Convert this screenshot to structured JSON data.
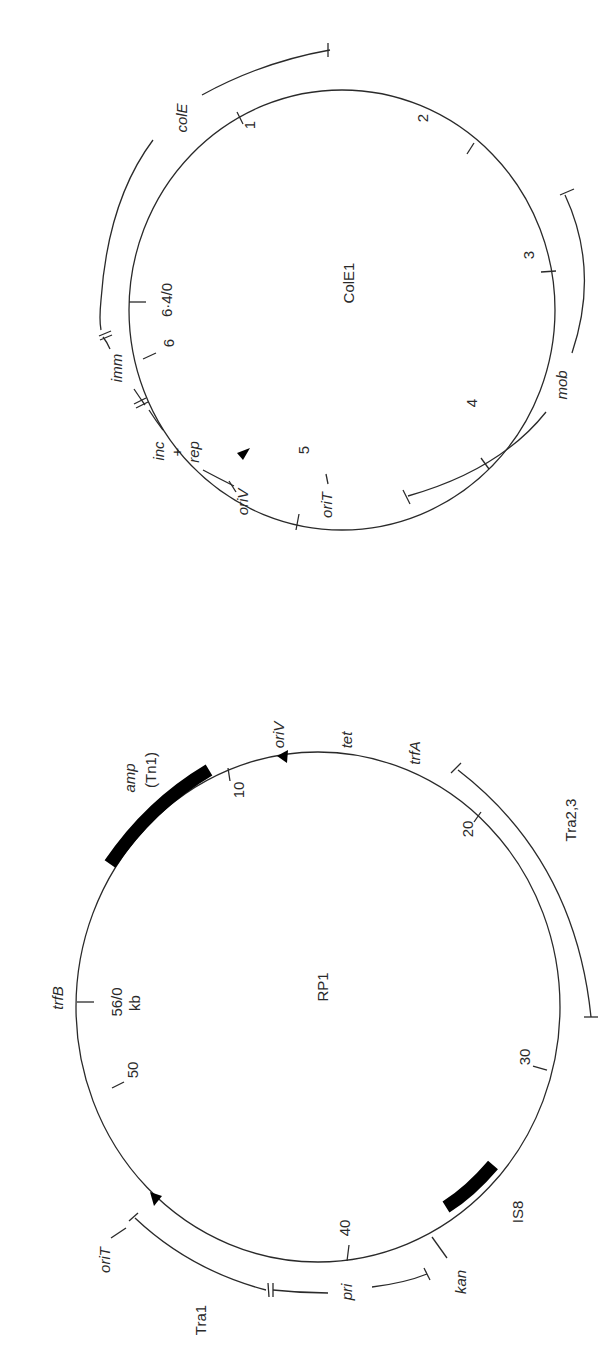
{
  "figure": {
    "orientation": "rotated 90 degrees counter-clockwise",
    "maps": [
      {
        "id": "cole1",
        "name": "ColE1",
        "size_kb": 6.4,
        "origin_label": "6·4/0",
        "ticks": [
          {
            "kb": 1,
            "label": "1"
          },
          {
            "kb": 2,
            "label": "2"
          },
          {
            "kb": 3,
            "label": "3"
          },
          {
            "kb": 4,
            "label": "4"
          },
          {
            "kb": 5,
            "label": "5"
          },
          {
            "kb": 6,
            "label": "6"
          }
        ],
        "regions": [
          {
            "name": "colE",
            "italic": true
          },
          {
            "name": "mob",
            "italic": true
          },
          {
            "name": "imm",
            "italic": true
          },
          {
            "name": "inc + rep",
            "italic": true
          }
        ],
        "sites": [
          {
            "name": "oriV",
            "italic": true,
            "marker": "arrow"
          },
          {
            "name": "oriT",
            "italic": true
          }
        ]
      },
      {
        "id": "rp1",
        "name": "RP1",
        "size_kb": 56,
        "origin_label": "56/0",
        "unit_label": "kb",
        "ticks": [
          {
            "kb": 10,
            "label": "10"
          },
          {
            "kb": 20,
            "label": "20"
          },
          {
            "kb": 30,
            "label": "30"
          },
          {
            "kb": 40,
            "label": "40"
          },
          {
            "kb": 50,
            "label": "50"
          }
        ],
        "regions": [
          {
            "name": "Tra2,3",
            "italic": false
          },
          {
            "name": "Tra1",
            "italic": false
          },
          {
            "name": "pri",
            "italic": true
          }
        ],
        "elements": [
          {
            "name": "amp",
            "sub": "(Tn1)",
            "type": "transposon-block"
          },
          {
            "name": "IS8",
            "type": "insertion-sequence-block"
          }
        ],
        "genes": [
          {
            "name": "tet",
            "italic": true
          },
          {
            "name": "trfA",
            "italic": true
          },
          {
            "name": "trfB",
            "italic": true
          },
          {
            "name": "kan",
            "italic": true
          }
        ],
        "sites": [
          {
            "name": "oriV",
            "italic": true,
            "marker": "arrow"
          },
          {
            "name": "oriT",
            "italic": true,
            "marker": "arrow"
          }
        ]
      }
    ]
  },
  "labels": {
    "cole1_name": "ColE1",
    "cole1_origin": "6·4/0",
    "cole1_t1": "1",
    "cole1_t2": "2",
    "cole1_t3": "3",
    "cole1_t4": "4",
    "cole1_t5": "5",
    "cole1_t6": "6",
    "cole1_colE": "colE",
    "cole1_mob": "mob",
    "cole1_imm": "imm",
    "cole1_inc": "inc",
    "cole1_plus": "+",
    "cole1_rep": "rep",
    "cole1_oriV": "oriV",
    "cole1_oriT": "oriT",
    "rp1_name": "RP1",
    "rp1_origin": "56/0",
    "rp1_unit": "kb",
    "rp1_t10": "10",
    "rp1_t20": "20",
    "rp1_t30": "30",
    "rp1_t40": "40",
    "rp1_t50": "50",
    "rp1_amp": "amp",
    "rp1_tn1": "(Tn1)",
    "rp1_is8": "IS8",
    "rp1_oriV": "oriV",
    "rp1_tet": "tet",
    "rp1_trfA": "trfA",
    "rp1_trfB": "trfB",
    "rp1_tra23": "Tra2,3",
    "rp1_tra1": "Tra1",
    "rp1_pri": "pri",
    "rp1_kan": "kan",
    "rp1_oriT": "oriT"
  }
}
